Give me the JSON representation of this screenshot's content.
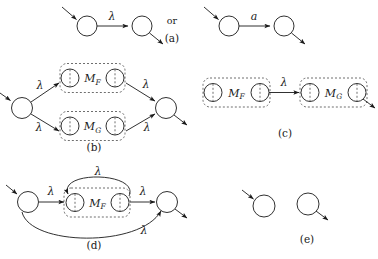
{
  "figure": {
    "stroke_color": "#1a1a1a",
    "dash_color": "#4a4a4a",
    "background": "#ffffff"
  },
  "panels": [
    {
      "id": "a",
      "label": "(a)",
      "connector": "or",
      "left_edge_label": "λ",
      "right_edge_label": "a",
      "description": "two states joined by a single labelled transition"
    },
    {
      "id": "b",
      "label": "(b)",
      "edges": [
        "λ",
        "λ",
        "λ",
        "λ"
      ],
      "blocks": [
        "M_F",
        "M_G"
      ],
      "description": "parallel composition of blocks M_F and M_G"
    },
    {
      "id": "c",
      "label": "(c)",
      "edges": [
        "λ"
      ],
      "blocks": [
        "M_F",
        "M_G"
      ],
      "description": "serial composition of blocks M_F and M_G"
    },
    {
      "id": "d",
      "label": "(d)",
      "edges": [
        "λ",
        "λ",
        "λ",
        "λ"
      ],
      "blocks": [
        "M_F"
      ],
      "description": "feedback loop around block M_F with a bypass arc"
    },
    {
      "id": "e",
      "label": "(e)",
      "description": "an entry state and an exit state"
    }
  ],
  "blocks": {
    "m_f": {
      "base": "M",
      "sub": "F"
    },
    "m_g": {
      "base": "M",
      "sub": "G"
    }
  },
  "symbols": {
    "lambda": "λ",
    "a": "a"
  }
}
